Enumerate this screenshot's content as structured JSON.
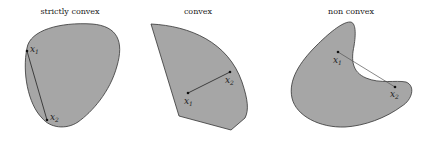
{
  "panels": [
    {
      "title": "strictly convex",
      "point1": {
        "base": "x",
        "sub": "1"
      },
      "point2": {
        "base": "x",
        "sub": "2"
      }
    },
    {
      "title": "convex",
      "point1": {
        "base": "x",
        "sub": "1"
      },
      "point2": {
        "base": "x",
        "sub": "2"
      }
    },
    {
      "title": "non convex",
      "point1": {
        "base": "x",
        "sub": "1"
      },
      "point2": {
        "base": "x",
        "sub": "2"
      }
    }
  ],
  "colors": {
    "fill": "#a6a6a6",
    "stroke": "#333333",
    "background": "#ffffff"
  }
}
